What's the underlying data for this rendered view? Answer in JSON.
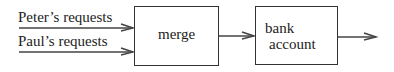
{
  "diagram": {
    "inputs": [
      {
        "label": "Peter’s requests"
      },
      {
        "label": "Paul’s requests"
      }
    ],
    "nodes": [
      {
        "id": "merge",
        "label": "merge"
      },
      {
        "id": "bank",
        "label_line1": "bank",
        "label_line2": "account"
      }
    ],
    "edges": [
      {
        "from": "Peter's requests",
        "to": "merge"
      },
      {
        "from": "Paul's requests",
        "to": "merge"
      },
      {
        "from": "merge",
        "to": "bank account"
      },
      {
        "from": "bank account",
        "to": "output"
      }
    ],
    "colors": {
      "stroke": "#333333",
      "text": "#222222",
      "background": "#ffffff"
    }
  }
}
